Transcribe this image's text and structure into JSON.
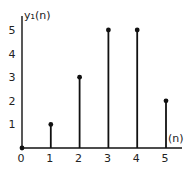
{
  "chart_data": {
    "type": "stem",
    "title": "",
    "xlabel": "(n)",
    "ylabel": "y₁(n)",
    "x": [
      0,
      1,
      2,
      3,
      4,
      5
    ],
    "values": [
      0,
      1,
      3,
      5,
      5,
      2
    ],
    "x_ticks": [
      "0",
      "1",
      "2",
      "3",
      "4",
      "5"
    ],
    "y_ticks": [
      "1",
      "2",
      "3",
      "4",
      "5"
    ],
    "xlim": [
      0,
      5.5
    ],
    "ylim": [
      0,
      5.7
    ],
    "grid": false,
    "legend": null,
    "color": "#111111"
  }
}
